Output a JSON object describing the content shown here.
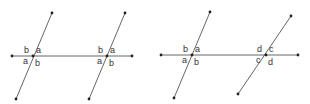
{
  "colors": {
    "line": "#555555",
    "point": "#222222",
    "label": "#333333",
    "background": "#ffffff"
  },
  "figures": [
    {
      "name": "figure-left",
      "horizontal": {
        "x1": 12,
        "y1": 56,
        "x2": 132,
        "y2": 56
      },
      "transversals": [
        {
          "x1": 52,
          "y1": 13,
          "x2": 16,
          "y2": 99,
          "ix": 33,
          "iy": 56,
          "labels": {
            "top_left": "b",
            "top_right": "a",
            "bottom_left": "a",
            "bottom_right": "b"
          }
        },
        {
          "x1": 125,
          "y1": 13,
          "x2": 89,
          "y2": 99,
          "ix": 107,
          "iy": 56,
          "labels": {
            "top_left": "b",
            "top_right": "a",
            "bottom_left": "a",
            "bottom_right": "b"
          }
        }
      ]
    },
    {
      "name": "figure-right",
      "horizontal": {
        "x1": 161,
        "y1": 55,
        "x2": 298,
        "y2": 55
      },
      "transversals": [
        {
          "x1": 210,
          "y1": 12,
          "x2": 174,
          "y2": 98,
          "ix": 192,
          "iy": 55,
          "labels": {
            "top_left": "b",
            "top_right": "a",
            "bottom_left": "a",
            "bottom_right": "b"
          }
        },
        {
          "x1": 291,
          "y1": 16,
          "x2": 238,
          "y2": 94,
          "ix": 266,
          "iy": 55,
          "labels": {
            "top_left": "d",
            "top_right": "c",
            "bottom_left": "c",
            "bottom_right": "d"
          }
        }
      ]
    }
  ]
}
